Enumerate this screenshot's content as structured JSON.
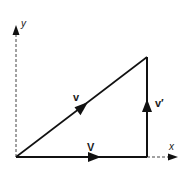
{
  "diagram": {
    "type": "vector-decomposition",
    "axes": {
      "x_label": "x",
      "y_label": "y",
      "origin": [
        16,
        157
      ],
      "x_end": [
        176,
        157
      ],
      "y_end": [
        16,
        26
      ],
      "style": "dashed"
    },
    "vectors": [
      {
        "name": "v",
        "label": "v",
        "from": [
          16,
          157
        ],
        "to": [
          147,
          57
        ],
        "arrow_at": [
          80,
          108
        ],
        "description": "diagonal resultant vector"
      },
      {
        "name": "V",
        "label": "V",
        "from": [
          16,
          157
        ],
        "to": [
          147,
          157
        ],
        "arrow_at": [
          95,
          157
        ],
        "description": "horizontal component"
      },
      {
        "name": "v-prime",
        "label": "v′",
        "from": [
          147,
          157
        ],
        "to": [
          147,
          57
        ],
        "arrow_at": [
          147,
          97
        ],
        "description": "vertical component"
      }
    ],
    "colors": {
      "line": "#111111",
      "axis": "#333333",
      "background": "#ffffff"
    }
  }
}
